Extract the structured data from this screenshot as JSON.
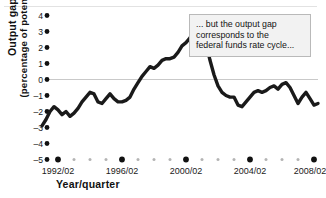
{
  "chart_data": {
    "type": "line",
    "title": "",
    "subtitle": "",
    "xlabel": "Year/quarter",
    "ylabel_line1": "Output gap",
    "ylabel_line2": "(percentage of potential GDP)",
    "ylim": [
      -5,
      4
    ],
    "yticks": [
      4,
      3,
      2,
      1,
      0,
      -1,
      -2,
      -3,
      -4,
      -5
    ],
    "ytick_labels": [
      "4",
      "3",
      "2",
      "1",
      "0",
      "–1",
      "–2",
      "–3",
      "–4",
      "–5"
    ],
    "xlim": [
      "1991/02",
      "2008/04"
    ],
    "xtick_labels": [
      "1992/02",
      "1996/02",
      "2000/02",
      "2004/02",
      "2008/02"
    ],
    "xtick_values": [
      1992.25,
      1996.25,
      2000.25,
      2004.25,
      2008.25
    ],
    "minor_tick_interval_years": 1,
    "grid": "zero-line-only",
    "legend": "none",
    "line_color": "#1a1a1a",
    "line_width_px": 3.4,
    "x": [
      1991.25,
      1991.5,
      1991.75,
      1992.0,
      1992.25,
      1992.5,
      1992.75,
      1993.0,
      1993.25,
      1993.5,
      1993.75,
      1994.0,
      1994.25,
      1994.5,
      1994.75,
      1995.0,
      1995.25,
      1995.5,
      1995.75,
      1996.0,
      1996.25,
      1996.5,
      1996.75,
      1997.0,
      1997.25,
      1997.5,
      1997.75,
      1998.0,
      1998.25,
      1998.5,
      1998.75,
      1999.0,
      1999.25,
      1999.5,
      1999.75,
      2000.0,
      2000.25,
      2000.5,
      2000.75,
      2001.0,
      2001.25,
      2001.5,
      2001.75,
      2002.0,
      2002.25,
      2002.5,
      2002.75,
      2003.0,
      2003.25,
      2003.5,
      2003.75,
      2004.0,
      2004.25,
      2004.5,
      2004.75,
      2005.0,
      2005.25,
      2005.5,
      2005.75,
      2006.0,
      2006.25,
      2006.5,
      2006.75,
      2007.0,
      2007.25,
      2007.5,
      2007.75,
      2008.0,
      2008.25,
      2008.5
    ],
    "values": [
      -2.9,
      -2.5,
      -2.0,
      -1.7,
      -1.9,
      -2.2,
      -2.0,
      -2.3,
      -2.1,
      -1.8,
      -1.4,
      -1.1,
      -0.8,
      -0.9,
      -1.4,
      -1.5,
      -1.2,
      -0.9,
      -1.2,
      -1.4,
      -1.4,
      -1.3,
      -1.1,
      -0.6,
      -0.2,
      0.2,
      0.5,
      0.8,
      0.7,
      0.9,
      1.2,
      1.3,
      1.3,
      1.4,
      1.7,
      2.1,
      2.3,
      2.6,
      3.0,
      2.6,
      3.1,
      2.3,
      1.2,
      0.3,
      -0.4,
      -0.8,
      -1.0,
      -1.1,
      -1.1,
      -1.6,
      -1.7,
      -1.4,
      -1.1,
      -0.8,
      -0.7,
      -0.8,
      -0.7,
      -0.5,
      -0.4,
      -0.6,
      -0.3,
      -0.2,
      -0.5,
      -1.0,
      -1.5,
      -1.1,
      -0.8,
      -1.2,
      -1.6,
      -1.5
    ]
  },
  "annotation": {
    "line1": "... but the output gap",
    "line2": "corresponds to the",
    "line3": "federal funds rate cycle..."
  }
}
